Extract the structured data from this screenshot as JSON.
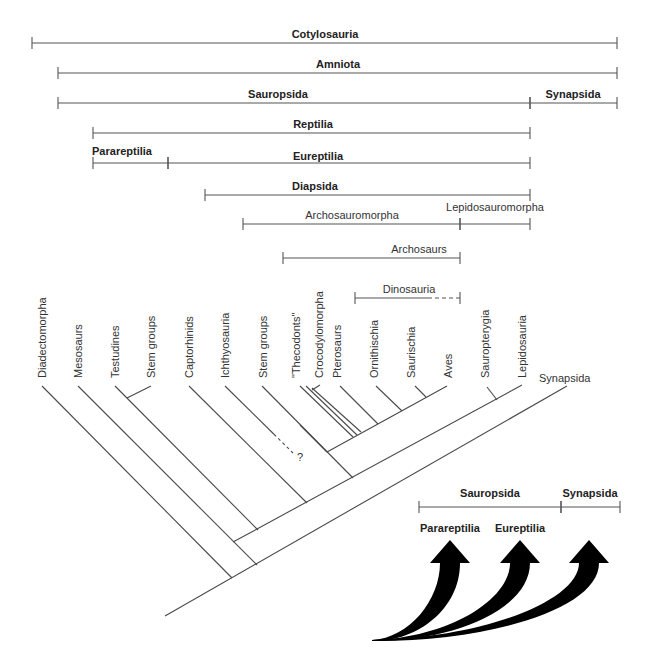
{
  "clade_bars": [
    {
      "id": "cotylosauria",
      "label": "Cotylosauria",
      "bold": true,
      "x1": 32,
      "x2": 617,
      "y": 43,
      "label_x": 325,
      "label_y": 38
    },
    {
      "id": "amniota",
      "label": "Amniota",
      "bold": true,
      "x1": 58,
      "x2": 617,
      "y": 73,
      "label_x": 338,
      "label_y": 68
    },
    {
      "id": "sauropsida",
      "label": "Sauropsida",
      "bold": true,
      "x1": 58,
      "x2": 530,
      "y": 103,
      "label_x": 278,
      "label_y": 98
    },
    {
      "id": "synapsida",
      "label": "Synapsida",
      "bold": true,
      "x1": 530,
      "x2": 617,
      "y": 103,
      "label_x": 573,
      "label_y": 98
    },
    {
      "id": "reptilia",
      "label": "Reptilia",
      "bold": true,
      "x1": 93,
      "x2": 530,
      "y": 133,
      "label_x": 313,
      "label_y": 128
    },
    {
      "id": "parareptilia",
      "label": "Parareptilia",
      "bold": true,
      "x1": 93,
      "x2": 168,
      "y": 163,
      "label_x": 122,
      "label_y": 155
    },
    {
      "id": "eureptilia",
      "label": "Eureptilia",
      "bold": true,
      "x1": 168,
      "x2": 530,
      "y": 163,
      "label_x": 318,
      "label_y": 160
    },
    {
      "id": "diapsida",
      "label": "Diapsida",
      "bold": true,
      "x1": 205,
      "x2": 530,
      "y": 195,
      "label_x": 315,
      "label_y": 190
    },
    {
      "id": "archosauromorpha",
      "label": "Archosauromorpha",
      "bold": false,
      "x1": 243,
      "x2": 460,
      "y": 224,
      "label_x": 352,
      "label_y": 219
    },
    {
      "id": "lepidosauromorpha",
      "label": "Lepidosauromorpha",
      "bold": false,
      "x1": 460,
      "x2": 530,
      "y": 224,
      "label_x": 495,
      "label_y": 211
    },
    {
      "id": "archosaurs",
      "label": "Archosaurs",
      "bold": false,
      "x1": 283,
      "x2": 460,
      "y": 258,
      "label_x": 419,
      "label_y": 253
    },
    {
      "id": "dinosauria",
      "label": "Dinosauria",
      "bold": false,
      "x1": 355,
      "x2": 460,
      "y": 298,
      "dashed_from": 428,
      "label_x": 409,
      "label_y": 293
    }
  ],
  "taxa": [
    {
      "id": "diadectomorpha",
      "label": "Diadectomorpha",
      "x": 46,
      "y": 378,
      "quoted": false
    },
    {
      "id": "mesosaurs",
      "label": "Mesosaurs",
      "x": 82,
      "y": 378,
      "quoted": false
    },
    {
      "id": "testudines",
      "label": "Testudines",
      "x": 119,
      "y": 378,
      "quoted": false
    },
    {
      "id": "stem-groups-1",
      "label": "Stem groups",
      "x": 155,
      "y": 378,
      "quoted": false
    },
    {
      "id": "captorhinids",
      "label": "Captorhinids",
      "x": 193,
      "y": 378,
      "quoted": false
    },
    {
      "id": "ichthyosauria",
      "label": "Ichthyosauria",
      "x": 229,
      "y": 378,
      "quoted": false
    },
    {
      "id": "stem-groups-2",
      "label": "Stem groups",
      "x": 267,
      "y": 378,
      "quoted": false
    },
    {
      "id": "thecodonts",
      "label": "\"Thecodonts\"",
      "x": 300,
      "y": 378,
      "quoted": true
    },
    {
      "id": "crocodylomorpha",
      "label": "Crocodylomorpha",
      "x": 323,
      "y": 378,
      "quoted": false
    },
    {
      "id": "pterosaurs",
      "label": "Pterosaurs",
      "x": 341,
      "y": 378,
      "quoted": false
    },
    {
      "id": "ornithischia",
      "label": "Ornithischia",
      "x": 378,
      "y": 378,
      "quoted": false
    },
    {
      "id": "saurischia",
      "label": "Saurischia",
      "x": 415,
      "y": 378,
      "quoted": false
    },
    {
      "id": "aves",
      "label": "Aves",
      "x": 452,
      "y": 378,
      "quoted": false
    },
    {
      "id": "sauropterygia",
      "label": "Sauropterygia",
      "x": 489,
      "y": 378,
      "quoted": false
    },
    {
      "id": "lepidosauria",
      "label": "Lepidosauria",
      "x": 526,
      "y": 378,
      "quoted": false
    }
  ],
  "synapsida_tip_label": {
    "label": "Synapsida",
    "x": 539,
    "y": 382
  },
  "uncertain_mark": "?",
  "tree_branches": [
    {
      "id": "main-trunk",
      "x1": 165,
      "y1": 616,
      "x2": 567,
      "y2": 386
    },
    {
      "id": "diadectomorpha-branch",
      "x1": 42,
      "y1": 386,
      "x2": 232,
      "y2": 578
    },
    {
      "id": "mesosaurs-branch",
      "x1": 78,
      "y1": 386,
      "x2": 257,
      "y2": 565
    },
    {
      "id": "reptile-axis",
      "x1": 233,
      "y1": 542,
      "x2": 522,
      "y2": 385
    },
    {
      "id": "testudines-branch",
      "x1": 115,
      "y1": 386,
      "x2": 258,
      "y2": 530
    },
    {
      "id": "stem-groups-1-branch",
      "x1": 151,
      "y1": 386,
      "x2": 127,
      "y2": 398
    },
    {
      "id": "captorhinids-branch",
      "x1": 189,
      "y1": 386,
      "x2": 307,
      "y2": 503
    },
    {
      "id": "stem-groups-2-branch",
      "x1": 262,
      "y1": 386,
      "x2": 353,
      "y2": 478
    },
    {
      "id": "archosaur-axis",
      "x1": 327,
      "y1": 452,
      "x2": 447,
      "y2": 386
    },
    {
      "id": "archosaur-stem-link",
      "x1": 300,
      "y1": 425,
      "x2": 327,
      "y2": 452
    },
    {
      "id": "thecodont-branch-a",
      "x1": 300,
      "y1": 386,
      "x2": 353,
      "y2": 437
    },
    {
      "id": "thecodont-branch-b",
      "x1": 306,
      "y1": 386,
      "x2": 357,
      "y2": 435
    },
    {
      "id": "thecodont-branch-c",
      "x1": 312,
      "y1": 388,
      "x2": 361,
      "y2": 432
    },
    {
      "id": "crocodylomorpha-branch",
      "x1": 320,
      "y1": 385,
      "x2": 312,
      "y2": 390
    },
    {
      "id": "pterosaurs-branch",
      "x1": 340,
      "y1": 386,
      "x2": 378,
      "y2": 424
    },
    {
      "id": "ornithischia-branch",
      "x1": 376,
      "y1": 386,
      "x2": 402,
      "y2": 411
    },
    {
      "id": "saurischia-branch",
      "x1": 415,
      "y1": 386,
      "x2": 426,
      "y2": 397
    },
    {
      "id": "sauropterygia-branch",
      "x1": 487,
      "y1": 387,
      "x2": 497,
      "y2": 400
    }
  ],
  "dashed_branches": [
    {
      "id": "ichthyosauria-branch",
      "x1": 225,
      "y1": 386,
      "x2": 293,
      "y2": 453
    }
  ],
  "inset": {
    "bars": [
      {
        "id": "inset-sauropsida",
        "label": "Sauropsida",
        "x1": 419,
        "x2": 561,
        "y": 507,
        "label_x": 490,
        "label_y": 497
      },
      {
        "id": "inset-synapsida",
        "label": "Synapsida",
        "x1": 561,
        "x2": 620,
        "y": 507,
        "label_x": 590,
        "label_y": 497
      }
    ],
    "arrow_labels": [
      {
        "id": "inset-parareptilia",
        "label": "Parareptilia",
        "x": 450,
        "y": 532
      },
      {
        "id": "inset-eureptilia",
        "label": "Eureptilia",
        "x": 520,
        "y": 532
      }
    ],
    "arrows": [
      {
        "id": "arrow-parareptilia",
        "tip_x": 450,
        "tip_y": 540
      },
      {
        "id": "arrow-eureptilia",
        "tip_x": 520,
        "tip_y": 540
      },
      {
        "id": "arrow-synapsida",
        "tip_x": 589,
        "tip_y": 540
      }
    ],
    "origin": {
      "x": 372,
      "y": 640
    }
  },
  "colors": {
    "line": "#555555",
    "text": "#222222",
    "arrow": "#000000",
    "background": "#ffffff"
  }
}
